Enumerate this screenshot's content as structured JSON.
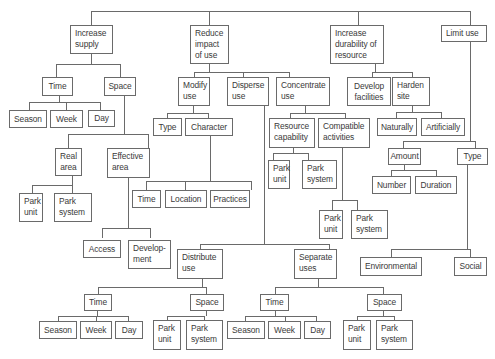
{
  "diagram": {
    "type": "tree",
    "nodes": {
      "increase_supply": "Increase\nsupply",
      "is_time": "Time",
      "is_space": "Space",
      "is_time_season": "Season",
      "is_time_week": "Week",
      "is_time_day": "Day",
      "real_area": "Real\narea",
      "effective_area": "Effective\narea",
      "ra_park_unit": "Park\nunit",
      "ra_park_system": "Park\nsystem",
      "access": "Access",
      "development": "Develop-\nment",
      "reduce_impact": "Reduce\nimpact\nof use",
      "modify_use": "Modify\nuse",
      "disperse_use": "Disperse\nuse",
      "concentrate_use": "Concentrate\nuse",
      "mu_type": "Type",
      "mu_character": "Character",
      "ch_time": "Time",
      "ch_location": "Location",
      "ch_practices": "Practices",
      "resource_capability": "Resource\ncapability",
      "compatible_activities": "Compatible\nactivities",
      "rc_park_unit": "Park\nunit",
      "rc_park_system": "Park\nsystem",
      "ca_park_unit": "Park\nunit",
      "ca_park_system": "Park\nsystem",
      "distribute_use": "Distribute\nuse",
      "separate_uses": "Separate\nuses",
      "du_time": "Time",
      "du_space": "Space",
      "du_season": "Season",
      "du_week": "Week",
      "du_day": "Day",
      "du_park_unit": "Park\nunit",
      "du_park_system": "Park\nsystem",
      "su_time": "Time",
      "su_space": "Space",
      "su_season": "Season",
      "su_week": "Week",
      "su_day": "Day",
      "su_park_unit": "Park\nunit",
      "su_park_system": "Park\nsystem",
      "increase_durability": "Increase\ndurability of\nresource",
      "develop_facilities": "Develop\nfacilities",
      "harden_site": "Harden\nsite",
      "naturally": "Naturally",
      "artificially": "Artificially",
      "limit_use": "Limit use",
      "lu_amount": "Amount",
      "lu_type": "Type",
      "number": "Number",
      "duration": "Duration",
      "environmental": "Environmental",
      "social": "Social"
    },
    "colors": {
      "line": "#6a6a6a",
      "text": "#3a3a3a",
      "background": "#ffffff"
    }
  }
}
